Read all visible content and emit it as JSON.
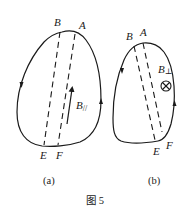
{
  "figure": {
    "caption": "图 5",
    "panels": [
      {
        "id": "a",
        "sublabel": "(a)",
        "points": {
          "B": "B",
          "A": "A",
          "E": "E",
          "F": "F"
        },
        "field_label_main": "B",
        "field_label_sub": "//",
        "field_description": "parallel field arrow pointing up"
      },
      {
        "id": "b",
        "sublabel": "(b)",
        "points": {
          "B": "B",
          "A": "A",
          "E": "E",
          "F": "F"
        },
        "field_label_main": "B",
        "field_label_sub": "⊥",
        "field_symbol": "⊗",
        "field_description": "perpendicular field into page"
      }
    ]
  },
  "colors": {
    "stroke": "#1a1a1a",
    "background": "#ffffff"
  }
}
